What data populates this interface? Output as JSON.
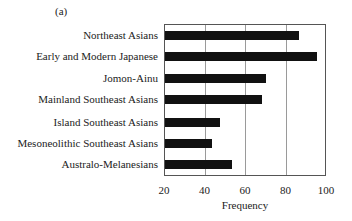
{
  "chart_data": {
    "type": "bar",
    "orientation": "horizontal",
    "panel_label": "(a)",
    "title": "",
    "xlabel": "Frequency",
    "ylabel": "",
    "xlim": [
      20,
      100
    ],
    "xticks": [
      "20",
      "40",
      "60",
      "80",
      "100"
    ],
    "grid": {
      "vertical": true,
      "positions": [
        40,
        60,
        80
      ]
    },
    "legend": null,
    "categories": [
      "Northeast Asians",
      "Early and Modern Japanese",
      "Jomon-Ainu",
      "Mainland Southeast Asians",
      "Island Southeast Asians",
      "Mesoneolithic Southeast Asians",
      "Australo-Melanesians"
    ],
    "values": [
      86,
      95,
      70,
      68,
      47,
      43,
      53
    ],
    "bar_color": "#111111"
  }
}
